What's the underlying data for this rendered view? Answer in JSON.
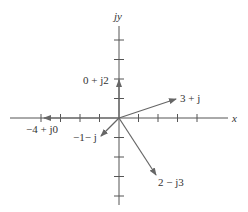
{
  "diagram": {
    "title": "",
    "type": "complex-plane-phasor-diagram",
    "colors": {
      "axis": "#555555",
      "vector": "#666666",
      "text": "#333333"
    },
    "origin_px": [
      119,
      118
    ],
    "unit_px": 19.5,
    "axes": {
      "x_label": "x",
      "y_label": "jy",
      "x_ticks": [
        -4,
        -3,
        -2,
        -1,
        1,
        2,
        3,
        4
      ],
      "y_ticks": [
        4,
        3,
        2,
        1,
        -1,
        -2,
        -3,
        -4
      ]
    },
    "vectors": [
      {
        "id": "v1",
        "label": "3 + j",
        "re": 3,
        "im": 1
      },
      {
        "id": "v2",
        "label": "0 + j2",
        "re": 0,
        "im": 2
      },
      {
        "id": "v3",
        "label": "−4 + j0",
        "re": -4,
        "im": 0
      },
      {
        "id": "v4",
        "label": "−1− j",
        "re": -1,
        "im": -1
      },
      {
        "id": "v5",
        "label": "2 − j3",
        "re": 2,
        "im": -3
      }
    ]
  }
}
